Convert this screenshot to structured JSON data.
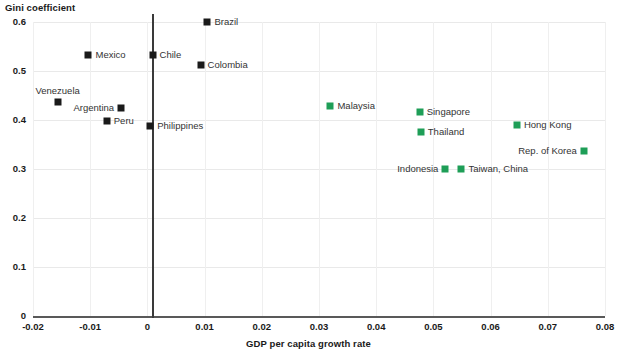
{
  "chart_data": {
    "type": "scatter",
    "title": "",
    "xlabel": "GDP per capita growth rate",
    "ylabel": "Gini coefficient",
    "xlim": [
      -0.02,
      0.08
    ],
    "ylim": [
      0,
      0.6
    ],
    "xticks": [
      "-0.02",
      "-0.01",
      "0",
      "0.01",
      "0.02",
      "0.03",
      "0.04",
      "0.05",
      "0.06",
      "0.07",
      "0.08"
    ],
    "yticks": [
      "0",
      "0.1",
      "0.2",
      "0.3",
      "0.4",
      "0.5",
      "0.6"
    ],
    "grid": true,
    "legend": "none",
    "colors": {
      "latin_america": "#1a1a1a",
      "asia": "#1e9e57",
      "gridline": "#e9e9e9",
      "axis": "#595959"
    },
    "points": [
      {
        "label": "Brazil",
        "x": 0.0105,
        "y": 0.6,
        "group": "latam",
        "label_pos": "right"
      },
      {
        "label": "Mexico",
        "x": -0.0103,
        "y": 0.533,
        "group": "latam",
        "label_pos": "right"
      },
      {
        "label": "Chile",
        "x": 0.0009,
        "y": 0.533,
        "group": "latam",
        "label_pos": "right"
      },
      {
        "label": "Colombia",
        "x": 0.0093,
        "y": 0.512,
        "group": "latam",
        "label_pos": "right"
      },
      {
        "label": "Venezuela",
        "x": -0.0157,
        "y": 0.437,
        "group": "latam",
        "label_pos": "top"
      },
      {
        "label": "Argentina",
        "x": -0.0046,
        "y": 0.425,
        "group": "latam",
        "label_pos": "left"
      },
      {
        "label": "Peru",
        "x": -0.0071,
        "y": 0.398,
        "group": "latam",
        "label_pos": "right"
      },
      {
        "label": "Philippines",
        "x": 0.0005,
        "y": 0.388,
        "group": "latam",
        "label_pos": "right"
      },
      {
        "label": "Malaysia",
        "x": 0.032,
        "y": 0.429,
        "group": "asia",
        "label_pos": "right"
      },
      {
        "label": "Singapore",
        "x": 0.0476,
        "y": 0.416,
        "group": "asia",
        "label_pos": "right"
      },
      {
        "label": "Thailand",
        "x": 0.0478,
        "y": 0.375,
        "group": "asia",
        "label_pos": "right"
      },
      {
        "label": "Hong Kong",
        "x": 0.0646,
        "y": 0.39,
        "group": "asia",
        "label_pos": "right"
      },
      {
        "label": "Rep. of Korea",
        "x": 0.0763,
        "y": 0.337,
        "group": "asia",
        "label_pos": "left"
      },
      {
        "label": "Indonesia",
        "x": 0.0521,
        "y": 0.3,
        "group": "asia",
        "label_pos": "left"
      },
      {
        "label": "Taiwan, China",
        "x": 0.0549,
        "y": 0.3,
        "group": "asia",
        "label_pos": "right"
      }
    ]
  }
}
